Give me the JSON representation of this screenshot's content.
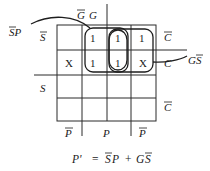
{
  "kmap": {
    "column_headers": {
      "G_bar": "G",
      "G": "G"
    },
    "row_headers": {
      "S_bar": "S",
      "S": "S"
    },
    "right_labels": [
      "C",
      "C",
      "C"
    ],
    "right_labels_bar": [
      true,
      false,
      true
    ],
    "bottom_labels": [
      "P",
      "P",
      "P"
    ],
    "bottom_labels_bar": [
      true,
      false,
      true
    ],
    "cells": [
      [
        "",
        "1",
        "1",
        "1"
      ],
      [
        "X",
        "1",
        "1",
        "X"
      ],
      [
        "",
        "",
        "",
        ""
      ],
      [
        "",
        "",
        "",
        ""
      ]
    ],
    "groups": [
      {
        "term": "S̄P",
        "label_text": "SP"
      },
      {
        "term": "GS̄",
        "label_text": "GS"
      }
    ]
  },
  "equation": {
    "lhs": "P'",
    "eq": "=",
    "term1_a": "S",
    "term1_b": "P",
    "plus": "+",
    "term2_a": "G",
    "term2_b": "S"
  }
}
